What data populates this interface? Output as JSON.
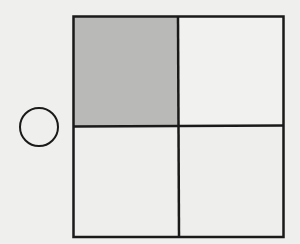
{
  "diagram": {
    "background_color": "#efefed",
    "stroke_color": "#1a1a1a",
    "shaded_color": "#b9b9b7",
    "grid": {
      "rows": 2,
      "cols": 2,
      "cells": [
        {
          "row": 0,
          "col": 0,
          "shaded": true
        },
        {
          "row": 0,
          "col": 1,
          "shaded": false
        },
        {
          "row": 1,
          "col": 0,
          "shaded": false
        },
        {
          "row": 1,
          "col": 1,
          "shaded": false
        }
      ]
    },
    "circle": {
      "filled": false
    }
  }
}
